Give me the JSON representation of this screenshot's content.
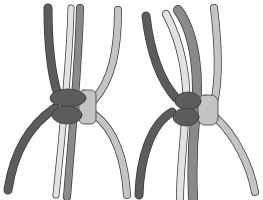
{
  "figure": {
    "panels": [
      {
        "id": "left",
        "label": "knot-step-1"
      },
      {
        "id": "right",
        "label": "knot-step-2"
      }
    ],
    "colors": {
      "dark_cord": "#5c5c5c",
      "medium_cord": "#8a8a8a",
      "light_cord": "#c4c4c4",
      "pale_cord": "#e2e2e2",
      "outline": "#3a3a3a",
      "background": "#ffffff"
    }
  }
}
